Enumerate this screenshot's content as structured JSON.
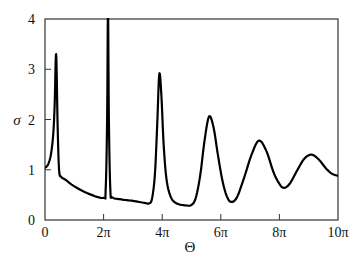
{
  "chart_data": {
    "type": "line",
    "title": "",
    "xlabel": "Θ",
    "ylabel": "σ",
    "xlim_over_pi": [
      0,
      10
    ],
    "ylim": [
      0,
      4
    ],
    "grid": false,
    "legend": null,
    "x_ticks": [
      {
        "value_over_pi": 0,
        "label": "0"
      },
      {
        "value_over_pi": 2,
        "label": "2π"
      },
      {
        "value_over_pi": 4,
        "label": "4π"
      },
      {
        "value_over_pi": 6,
        "label": "6π"
      },
      {
        "value_over_pi": 8,
        "label": "8π"
      },
      {
        "value_over_pi": 10,
        "label": "10π"
      }
    ],
    "y_ticks": [
      {
        "value": 0,
        "label": "0"
      },
      {
        "value": 1,
        "label": "1"
      },
      {
        "value": 2,
        "label": "2"
      },
      {
        "value": 3,
        "label": "3"
      },
      {
        "value": 4,
        "label": "4"
      }
    ],
    "series": [
      {
        "name": "σ(Θ)",
        "color": "#000000",
        "x_over_pi": [
          0,
          0.1,
          0.2,
          0.28,
          0.33,
          0.38,
          0.43,
          0.48,
          0.55,
          0.7,
          1.0,
          1.5,
          2.0,
          2.07,
          2.12,
          2.15,
          2.18,
          2.23,
          2.3,
          2.6,
          3.0,
          3.4,
          3.55,
          3.65,
          3.75,
          3.83,
          3.9,
          3.97,
          4.05,
          4.15,
          4.3,
          4.5,
          4.8,
          5.0,
          5.15,
          5.3,
          5.45,
          5.6,
          5.75,
          5.9,
          6.05,
          6.2,
          6.35,
          6.55,
          6.8,
          7.05,
          7.3,
          7.55,
          7.8,
          8.0,
          8.15,
          8.35,
          8.6,
          8.85,
          9.1,
          9.35,
          9.6,
          9.8,
          10.0
        ],
        "y": [
          1.04,
          1.1,
          1.3,
          1.7,
          2.3,
          3.3,
          1.9,
          1.0,
          0.86,
          0.8,
          0.67,
          0.52,
          0.44,
          0.6,
          2.0,
          4.2,
          2.0,
          0.6,
          0.45,
          0.41,
          0.38,
          0.34,
          0.33,
          0.42,
          0.9,
          1.9,
          2.9,
          2.5,
          1.5,
          0.8,
          0.45,
          0.33,
          0.29,
          0.3,
          0.45,
          0.9,
          1.6,
          2.06,
          1.85,
          1.3,
          0.8,
          0.48,
          0.36,
          0.45,
          0.85,
          1.3,
          1.58,
          1.38,
          0.95,
          0.72,
          0.64,
          0.72,
          0.98,
          1.22,
          1.3,
          1.2,
          1.02,
          0.92,
          0.88
        ]
      }
    ],
    "annotations": []
  },
  "plot_area": {
    "left": 45,
    "top": 19,
    "right": 338,
    "bottom": 220
  }
}
